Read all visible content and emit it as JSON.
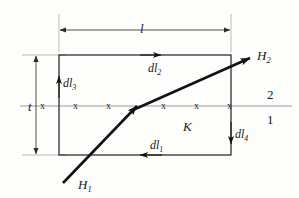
{
  "figure": {
    "background_color": "#fdfdfb",
    "ink_color": "#1a1a1a",
    "thin_line_color": "#8a8a8a"
  },
  "labels": {
    "length": "l",
    "thickness": "t",
    "dl1": "dl",
    "dl1_sub": "1",
    "dl2": "dl",
    "dl2_sub": "2",
    "dl3": "dl",
    "dl3_sub": "3",
    "dl4": "dl",
    "dl4_sub": "4",
    "h1": "H",
    "h1_sub": "1",
    "h2": "H",
    "h2_sub": "2",
    "surface_current": "K",
    "region_upper": "2",
    "region_lower": "1"
  },
  "interface": {
    "current_symbol": "x",
    "symbol_meaning": "current-into-page",
    "marks": [
      {
        "x": 44
      },
      {
        "x": 77
      },
      {
        "x": 110
      },
      {
        "x": 165
      },
      {
        "x": 198
      },
      {
        "x": 231
      }
    ],
    "y": 106
  },
  "loop": {
    "left": 59,
    "right": 231,
    "top": 55,
    "bottom": 155,
    "segments": [
      {
        "name": "dl2",
        "edge": "top",
        "direction": "right"
      },
      {
        "name": "dl4",
        "edge": "right",
        "direction": "down"
      },
      {
        "name": "dl1",
        "edge": "bottom",
        "direction": "left"
      },
      {
        "name": "dl3",
        "edge": "left",
        "direction": "up"
      }
    ]
  },
  "field_ray": {
    "incident_start": {
      "x": 63,
      "y": 183
    },
    "bend_point": {
      "x": 137,
      "y": 106
    },
    "exit_end": {
      "x": 250,
      "y": 58
    }
  },
  "dimensions": {
    "length_line_y": 30,
    "length_from_x": 59,
    "length_to_x": 231,
    "thickness_line_x": 36,
    "thickness_from_y": 55,
    "thickness_to_y": 155
  }
}
